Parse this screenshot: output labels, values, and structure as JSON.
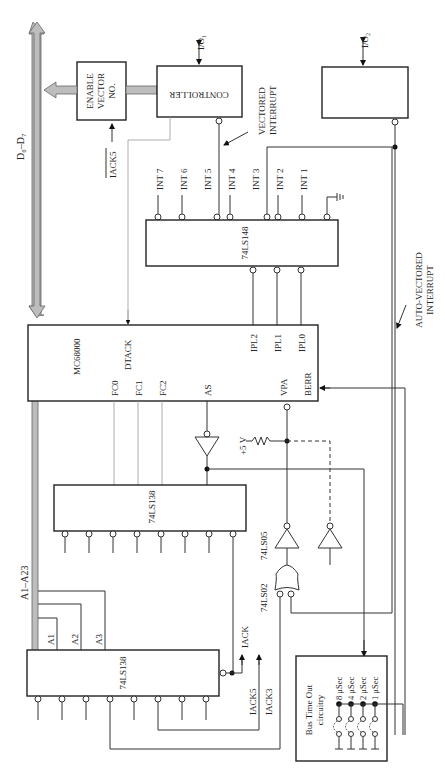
{
  "diagram": {
    "buses": {
      "data_bus": "D0–D7",
      "address_bus": "A1–A23"
    },
    "blocks": {
      "enable_vector": [
        "ENABLE",
        "VECTOR",
        "NO."
      ],
      "controller": "CONTROLLER",
      "io1": "I/O1",
      "io2": "I/O2",
      "cpu": "MC68000",
      "encoder": "74LS148",
      "decoder_fc": "74LS138",
      "decoder_addr": "74LS138",
      "bus_timeout": [
        "Bus Time Out",
        "circuitry"
      ]
    },
    "cpu_pins": [
      "DTACK",
      "FC0",
      "FC1",
      "FC2",
      "AS",
      "VPA",
      "BERR",
      "IPL2",
      "IPL1",
      "IPL0"
    ],
    "encoder_inputs": [
      "INT 7",
      "INT 6",
      "INT 5",
      "INT 4",
      "INT 3",
      "INT 2",
      "INT 1"
    ],
    "address_lines": [
      "A1",
      "A2",
      "A3"
    ],
    "signals": {
      "iack5_top": "IACK5",
      "iack": "IACK",
      "iack5": "IACK5",
      "iack3": "IACK3",
      "plus5v": "+5 V"
    },
    "gates": {
      "inverter": "74LS05",
      "nor": "74LS02"
    },
    "annotations": {
      "vectored": [
        "VECTORED",
        "INTERRUPT"
      ],
      "autovectored": [
        "AUTO-VECTORED",
        "INTERRUPT"
      ]
    },
    "timeout_options": [
      "8 μSec",
      "4 μSec",
      "2 μSec",
      "1 μSec"
    ]
  }
}
